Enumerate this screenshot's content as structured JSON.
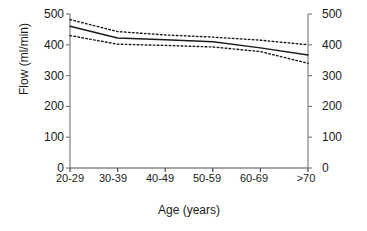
{
  "chart_data": {
    "type": "line",
    "title": "",
    "xlabel": "Age (years)",
    "ylabel": "Flow (ml/min)",
    "categories": [
      "20-29",
      "30-39",
      "40-49",
      "50-59",
      "60-69",
      ">70"
    ],
    "ylim": [
      0,
      500
    ],
    "yticks": [
      0,
      100,
      200,
      300,
      400,
      500
    ],
    "ytick_labels_left": [
      "0",
      "100",
      "200",
      "300",
      "400",
      "500"
    ],
    "ytick_labels_right": [
      "0",
      "100",
      "200",
      "300",
      "400",
      "500"
    ],
    "grid": false,
    "legend": null,
    "dual_y_axis": true,
    "series": [
      {
        "name": "Mean flow",
        "style": "solid",
        "color": "#1a1a1a",
        "values": [
          460,
          422,
          416,
          410,
          390,
          367
        ]
      },
      {
        "name": "Upper confidence limit",
        "style": "dotted",
        "color": "#1a1a1a",
        "values": [
          482,
          443,
          432,
          425,
          415,
          400
        ]
      },
      {
        "name": "Lower confidence limit",
        "style": "dotted",
        "color": "#1a1a1a",
        "values": [
          430,
          402,
          398,
          393,
          378,
          340
        ]
      }
    ]
  },
  "axis": {
    "y_title": "Flow (ml/min)",
    "x_title": "Age (years)"
  }
}
